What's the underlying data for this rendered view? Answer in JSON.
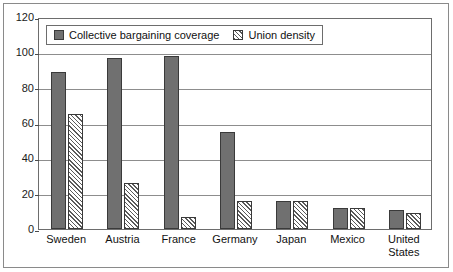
{
  "chart_data": {
    "type": "bar",
    "title": "",
    "xlabel": "",
    "ylabel": "",
    "ylim": [
      0,
      120
    ],
    "yticks": [
      0,
      20,
      40,
      60,
      80,
      100,
      120
    ],
    "ytick_labels": [
      "0",
      "20",
      "40",
      "60",
      "80",
      "100",
      "120"
    ],
    "grid": true,
    "legend_position": "upper-left-inside",
    "categories": [
      "Sweden",
      "Austria",
      "France",
      "Germany",
      "Japan",
      "Mexico",
      "United States"
    ],
    "category_lines": [
      [
        "Sweden"
      ],
      [
        "Austria"
      ],
      [
        "France"
      ],
      [
        "Germany"
      ],
      [
        "Japan"
      ],
      [
        "Mexico"
      ],
      [
        "United",
        "States"
      ]
    ],
    "series": [
      {
        "name": "Collective bargaining coverage",
        "pattern": "solid",
        "color": "#707070",
        "values": [
          89,
          97,
          98,
          55,
          16,
          12,
          11
        ]
      },
      {
        "name": "Union density",
        "pattern": "diagonal-hatch",
        "color": "#ffffff",
        "values": [
          65,
          26,
          7,
          16,
          16,
          12,
          9
        ]
      }
    ]
  },
  "legend": {
    "entries": [
      {
        "label": "Collective bargaining coverage",
        "swatch": "solid"
      },
      {
        "label": "Union density",
        "swatch": "hatch"
      }
    ]
  }
}
